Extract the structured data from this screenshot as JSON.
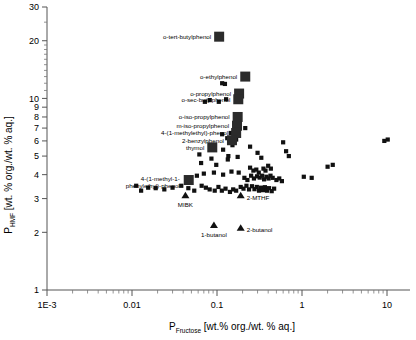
{
  "chart_data": {
    "type": "scatter",
    "title": "",
    "xlabel": "P_Fructose [wt.% org./wt. % aq.]",
    "xlabel_main": "P",
    "xlabel_sub": "Fructose",
    "xlabel_units": "[wt.% org./wt. % aq.]",
    "ylabel": "P_HMF [wt.% org./wt.% aq.]",
    "ylabel_main": "P",
    "ylabel_sub": "HMF",
    "ylabel_units": "[wt. % org./wt. % aq.]",
    "xscale": "log",
    "yscale": "log",
    "xlim": [
      0.001,
      20
    ],
    "ylim": [
      1,
      30
    ],
    "grid": false,
    "legend": false,
    "xticks": [
      "1E-3",
      "0.01",
      "0.1",
      "1",
      "10"
    ],
    "xtick_values": [
      0.001,
      0.01,
      0.1,
      1,
      10
    ],
    "yticks": [
      "1",
      "2",
      "3",
      "4",
      "5",
      "6",
      "7",
      "8",
      "9",
      "10",
      "20",
      "30"
    ],
    "ytick_values": [
      1,
      2,
      3,
      4,
      5,
      6,
      7,
      8,
      9,
      10,
      20,
      30
    ],
    "series": [
      {
        "name": "solvents-unlabeled",
        "marker": "square",
        "color": "#111111",
        "points": [
          [
            0.105,
            9.6
          ],
          [
            0.128,
            9.9
          ],
          [
            0.115,
            12.0
          ],
          [
            0.124,
            11.9
          ],
          [
            0.072,
            9.6
          ],
          [
            0.082,
            9.8
          ],
          [
            0.215,
            7.0
          ],
          [
            0.163,
            6.5
          ],
          [
            0.168,
            6.1
          ],
          [
            0.152,
            5.7
          ],
          [
            0.245,
            5.6
          ],
          [
            0.118,
            5.4
          ],
          [
            0.175,
            4.95
          ],
          [
            0.136,
            5.0
          ],
          [
            0.086,
            4.85
          ],
          [
            0.134,
            4.8
          ],
          [
            0.3,
            5.2
          ],
          [
            0.332,
            4.9
          ],
          [
            0.245,
            4.35
          ],
          [
            0.268,
            4.2
          ],
          [
            0.29,
            4.25
          ],
          [
            0.31,
            4.1
          ],
          [
            0.352,
            4.3
          ],
          [
            0.372,
            4.2
          ],
          [
            0.4,
            4.45
          ],
          [
            0.43,
            4.3
          ],
          [
            0.21,
            3.85
          ],
          [
            0.228,
            3.75
          ],
          [
            0.252,
            3.95
          ],
          [
            0.272,
            3.82
          ],
          [
            0.296,
            3.92
          ],
          [
            0.318,
            3.86
          ],
          [
            0.34,
            3.95
          ],
          [
            0.358,
            3.78
          ],
          [
            0.382,
            3.9
          ],
          [
            0.404,
            3.82
          ],
          [
            0.426,
            3.95
          ],
          [
            0.452,
            3.85
          ],
          [
            0.5,
            3.75
          ],
          [
            0.54,
            3.82
          ],
          [
            0.58,
            3.7
          ],
          [
            0.19,
            3.45
          ],
          [
            0.205,
            3.38
          ],
          [
            0.222,
            3.5
          ],
          [
            0.238,
            3.35
          ],
          [
            0.258,
            3.48
          ],
          [
            0.276,
            3.36
          ],
          [
            0.294,
            3.45
          ],
          [
            0.312,
            3.3
          ],
          [
            0.33,
            3.42
          ],
          [
            0.348,
            3.32
          ],
          [
            0.366,
            3.44
          ],
          [
            0.388,
            3.3
          ],
          [
            0.41,
            3.4
          ],
          [
            0.44,
            3.28
          ],
          [
            0.47,
            3.38
          ],
          [
            0.066,
            3.5
          ],
          [
            0.074,
            3.42
          ],
          [
            0.082,
            3.35
          ],
          [
            0.094,
            3.3
          ],
          [
            0.104,
            3.45
          ],
          [
            0.114,
            3.3
          ],
          [
            0.126,
            3.38
          ],
          [
            0.142,
            3.25
          ],
          [
            0.155,
            3.35
          ],
          [
            0.168,
            3.3
          ],
          [
            0.046,
            3.4
          ],
          [
            0.054,
            3.3
          ],
          [
            0.038,
            3.5
          ],
          [
            0.03,
            3.42
          ],
          [
            0.024,
            3.35
          ],
          [
            0.019,
            3.4
          ],
          [
            0.0155,
            3.42
          ],
          [
            0.0128,
            3.3
          ],
          [
            0.0112,
            3.5
          ],
          [
            0.07,
            4.05
          ],
          [
            0.058,
            3.95
          ],
          [
            0.092,
            4.1
          ],
          [
            0.118,
            4.0
          ],
          [
            0.148,
            4.15
          ],
          [
            0.18,
            4.1
          ],
          [
            0.065,
            4.6
          ],
          [
            0.098,
            4.5
          ],
          [
            0.062,
            5.1
          ],
          [
            1.05,
            3.9
          ],
          [
            1.3,
            3.85
          ],
          [
            2.0,
            4.4
          ],
          [
            2.3,
            4.5
          ],
          [
            9.3,
            6.0
          ],
          [
            10.2,
            6.1
          ],
          [
            0.6,
            5.9
          ],
          [
            0.65,
            5.3
          ],
          [
            0.7,
            5.0
          ],
          [
            0.115,
            6.5
          ],
          [
            0.132,
            6.2
          ],
          [
            0.145,
            6.6
          ]
        ]
      },
      {
        "name": "labeled-phenols",
        "marker": "square-large",
        "color": "#2b2b2b",
        "points": [
          {
            "x": 0.106,
            "y": 21.0,
            "label": "o-tert-butylphenol",
            "label_side": "left"
          },
          {
            "x": 0.215,
            "y": 13.0,
            "label": "o-ethylphenol",
            "label_side": "left"
          },
          {
            "x": 0.182,
            "y": 10.6,
            "label": "o-propylphenol",
            "label_side": "left"
          },
          {
            "x": 0.178,
            "y": 9.9,
            "label": "o-sec-butylphenol",
            "label_side": "left"
          },
          {
            "x": 0.175,
            "y": 8.0,
            "label": "o-iso-propylphenol",
            "label_side": "left"
          },
          {
            "x": 0.172,
            "y": 7.2,
            "label": "m-iso-propylphenol",
            "label_side": "left"
          },
          {
            "x": 0.168,
            "y": 6.6,
            "label": "4-(1-methylethyl)-phenol",
            "label_side": "left"
          },
          {
            "x": 0.15,
            "y": 6.05,
            "label": "2-benzylphenol",
            "label_side": "left"
          },
          {
            "x": 0.088,
            "y": 5.55,
            "label": "thymol",
            "label_side": "left"
          },
          {
            "x": 0.0465,
            "y": 3.75,
            "label": "4-(1-methyl-1-phenylethyl)-phenol",
            "label_side": "left"
          }
        ]
      },
      {
        "name": "reference-solvents",
        "marker": "triangle",
        "color": "#111111",
        "points": [
          {
            "x": 0.0425,
            "y": 3.1,
            "label": "MIBK",
            "label_pos": "below"
          },
          {
            "x": 0.19,
            "y": 3.1,
            "label": "2-MTHF",
            "label_pos": "right"
          },
          {
            "x": 0.092,
            "y": 2.17,
            "label": "1-butanol",
            "label_pos": "below"
          },
          {
            "x": 0.19,
            "y": 2.1,
            "label": "2-butanol",
            "label_pos": "right"
          }
        ]
      }
    ]
  },
  "labels": {
    "o_tert_butylphenol": "o-tert-butylphenol",
    "o_ethylphenol": "o-ethylphenol",
    "o_propylphenol": "o-propylphenol",
    "o_sec_butylphenol": "o-sec-butylphenol",
    "o_iso_propylphenol": "o-iso-propylphenol",
    "m_iso_propylphenol": "m-iso-propylphenol",
    "methylethyl_phenol": "4-(1-methylethyl)-phenol",
    "benzylphenol": "2-benzylphenol",
    "thymol": "thymol",
    "phenylethyl_phenol_l1": "4-(1-methyl-1-",
    "phenylethyl_phenol_l2": "phenylethyl)-phenol",
    "mibk": "MIBK",
    "mthf": "2-MTHF",
    "butanol1": "1-butanol",
    "butanol2": "2-butanol"
  }
}
